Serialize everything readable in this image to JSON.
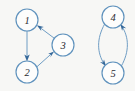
{
  "figure": {
    "title": "",
    "background_color": "#f7f7f5",
    "width": 135,
    "height": 91
  },
  "style": {
    "node_stroke_color": "#5f92bd",
    "node_fill_color": "#fdfdfc",
    "node_label_color": "#2a2a30",
    "edge_color": "#6f9dc4",
    "arrow_color": "#35689a"
  },
  "graph": {
    "type": "directed-graph",
    "node_radius": 11,
    "nodes": [
      {
        "id": "1",
        "label": "1",
        "cx": 27,
        "cy": 20,
        "r": 11
      },
      {
        "id": "2",
        "label": "2",
        "cx": 27,
        "cy": 72,
        "r": 11
      },
      {
        "id": "3",
        "label": "3",
        "cx": 63,
        "cy": 45,
        "r": 11
      },
      {
        "id": "4",
        "label": "4",
        "cx": 113,
        "cy": 17,
        "r": 11
      },
      {
        "id": "5",
        "label": "5",
        "cx": 113,
        "cy": 73,
        "r": 11
      }
    ],
    "edges": [
      {
        "id": "e1",
        "from": "1",
        "to": "2",
        "shape": "straight",
        "directed": true
      },
      {
        "id": "e2",
        "from": "2",
        "to": "3",
        "shape": "straight",
        "directed": true
      },
      {
        "id": "e3",
        "from": "3",
        "to": "1",
        "shape": "straight",
        "directed": true
      },
      {
        "id": "e4",
        "from": "4",
        "to": "5",
        "shape": "curved-left",
        "directed": true
      },
      {
        "id": "e5",
        "from": "5",
        "to": "4",
        "shape": "curved-right",
        "directed": true
      }
    ],
    "components": [
      {
        "id": "component-a",
        "members": [
          "1",
          "2",
          "3"
        ]
      },
      {
        "id": "component-b",
        "members": [
          "4",
          "5"
        ]
      }
    ]
  }
}
